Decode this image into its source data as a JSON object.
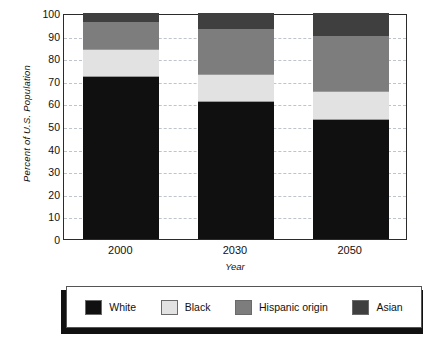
{
  "chart_data": {
    "type": "bar",
    "subtype": "stacked-bar",
    "title": "",
    "xlabel": "Year",
    "ylabel": "Percent of U.S. Population",
    "categories": [
      "2000",
      "2030",
      "2050"
    ],
    "ylim": [
      0,
      100
    ],
    "yticks": [
      0,
      10,
      20,
      30,
      40,
      50,
      60,
      70,
      80,
      90,
      100
    ],
    "grid": true,
    "grid_style": "dashed-horizontal",
    "legend_position": "bottom",
    "stack_order": [
      "White",
      "Black",
      "Hispanic origin",
      "Asian"
    ],
    "series": [
      {
        "name": "White",
        "color": "#101010",
        "values": [
          71.5,
          60.5,
          52.5
        ]
      },
      {
        "name": "Black",
        "color": "#e2e2e2",
        "values": [
          12.5,
          12.5,
          13.0
        ]
      },
      {
        "name": "Hispanic origin",
        "color": "#7d7d7d",
        "values": [
          12.0,
          20.0,
          24.5
        ]
      },
      {
        "name": "Asian",
        "color": "#3f3f3f",
        "values": [
          4.0,
          7.0,
          10.0
        ]
      }
    ],
    "cumulative_tops": {
      "2000": {
        "White": 71.5,
        "Black": 84.0,
        "Hispanic origin": 96.0,
        "Asian": 100.0
      },
      "2030": {
        "White": 60.5,
        "Black": 73.0,
        "Hispanic origin": 93.0,
        "Asian": 100.0
      },
      "2050": {
        "White": 52.5,
        "Black": 65.5,
        "Hispanic origin": 90.0,
        "Asian": 100.0
      }
    }
  },
  "axis": {
    "ytick_labels": [
      "100",
      "90",
      "80",
      "70",
      "60",
      "50",
      "40",
      "30",
      "20",
      "10",
      "0"
    ],
    "xtick_labels": [
      "2000",
      "2030",
      "2050"
    ],
    "xlabel": "Year",
    "ylabel": "Percent of U.S. Population"
  },
  "legend": {
    "items": [
      {
        "label": "White",
        "color": "#101010"
      },
      {
        "label": "Black",
        "color": "#e2e2e2"
      },
      {
        "label": "Hispanic origin",
        "color": "#7d7d7d"
      },
      {
        "label": "Asian",
        "color": "#3f3f3f"
      }
    ]
  }
}
